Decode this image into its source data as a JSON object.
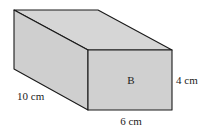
{
  "diagram": {
    "type": "cuboid",
    "face_label": "B",
    "dimensions": {
      "length_label": "10 cm",
      "width_label": "6 cm",
      "height_label": "4 cm"
    },
    "colors": {
      "face_fill": "#d0d0d0",
      "top_fill": "#d6d6d6",
      "side_fill": "#cfcfcf",
      "edge": "#1a1a1a"
    }
  }
}
